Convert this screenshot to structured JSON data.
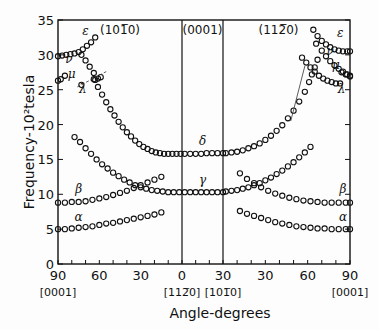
{
  "chart_data": {
    "type": "scatter",
    "title": "",
    "xlabel": "Angle-degrees",
    "ylabel": "Frequency-10²tesla",
    "ylim": [
      0,
      35
    ],
    "yticks": [
      0,
      5,
      10,
      15,
      20,
      25,
      30,
      35
    ],
    "panels": [
      {
        "name": "(10̅1̅0)",
        "label": "(101̅0)",
        "x_from": 90,
        "x_to": 0,
        "ticks": [
          90,
          60,
          30,
          0
        ]
      },
      {
        "name": "(0001)",
        "label": "(0001)",
        "x_from": 0,
        "x_to": 30,
        "ticks": [
          0,
          30
        ]
      },
      {
        "name": "(11̅2̅0)",
        "label": "(112̅0)",
        "x_from": 0,
        "x_to": 90,
        "ticks": [
          30,
          60,
          90
        ]
      }
    ],
    "x_tick_labels": [
      "90",
      "60",
      "30",
      "0",
      "30",
      "30",
      "60",
      "90"
    ],
    "direction_labels": [
      "[0001]",
      "[112̅0]",
      "[101̅0]",
      "[0001]"
    ],
    "series": [
      {
        "name": "alpha",
        "symbol": "α",
        "panel": 0,
        "points": [
          [
            90,
            5.0
          ],
          [
            85,
            5.0
          ],
          [
            80,
            5.1
          ],
          [
            75,
            5.2
          ],
          [
            70,
            5.3
          ],
          [
            65,
            5.4
          ],
          [
            60,
            5.6
          ],
          [
            55,
            5.8
          ],
          [
            50,
            5.9
          ],
          [
            45,
            6.1
          ],
          [
            40,
            6.3
          ],
          [
            35,
            6.5
          ],
          [
            30,
            6.7
          ],
          [
            25,
            6.9
          ],
          [
            20,
            7.1
          ],
          [
            15,
            7.4
          ]
        ]
      },
      {
        "name": "alpha",
        "symbol": "α",
        "panel": 2,
        "points": [
          [
            12,
            7.6
          ],
          [
            17,
            7.2
          ],
          [
            22,
            6.9
          ],
          [
            27,
            6.6
          ],
          [
            32,
            6.3
          ],
          [
            37,
            6.0
          ],
          [
            42,
            5.8
          ],
          [
            47,
            5.6
          ],
          [
            52,
            5.4
          ],
          [
            57,
            5.3
          ],
          [
            62,
            5.2
          ],
          [
            67,
            5.1
          ],
          [
            72,
            5.1
          ],
          [
            77,
            5.0
          ],
          [
            82,
            5.0
          ],
          [
            87,
            5.0
          ],
          [
            90,
            5.0
          ]
        ]
      },
      {
        "name": "beta",
        "symbol": "β",
        "panel": 0,
        "points": [
          [
            90,
            8.8
          ],
          [
            85,
            8.8
          ],
          [
            80,
            8.9
          ],
          [
            75,
            8.9
          ],
          [
            70,
            9.0
          ],
          [
            65,
            9.2
          ],
          [
            60,
            9.4
          ],
          [
            55,
            9.6
          ],
          [
            50,
            9.9
          ],
          [
            45,
            10.2
          ],
          [
            40,
            10.5
          ],
          [
            35,
            10.9
          ],
          [
            30,
            11.3
          ],
          [
            25,
            11.7
          ],
          [
            20,
            12.1
          ],
          [
            15,
            12.5
          ]
        ]
      },
      {
        "name": "beta",
        "symbol": "β",
        "panel": 2,
        "points": [
          [
            12,
            13.0
          ],
          [
            17,
            12.2
          ],
          [
            22,
            11.6
          ],
          [
            27,
            11.0
          ],
          [
            32,
            10.5
          ],
          [
            37,
            10.1
          ],
          [
            42,
            9.8
          ],
          [
            47,
            9.5
          ],
          [
            52,
            9.3
          ],
          [
            57,
            9.1
          ],
          [
            62,
            9.0
          ],
          [
            67,
            8.9
          ],
          [
            72,
            8.8
          ],
          [
            77,
            8.8
          ],
          [
            82,
            8.8
          ],
          [
            87,
            8.8
          ],
          [
            90,
            8.8
          ]
        ]
      },
      {
        "name": "gamma",
        "symbol": "γ",
        "panel": 0,
        "points": [
          [
            78,
            18.2
          ],
          [
            74,
            17.5
          ],
          [
            70,
            16.6
          ],
          [
            66,
            15.8
          ],
          [
            62,
            15.0
          ],
          [
            58,
            14.3
          ],
          [
            54,
            13.7
          ],
          [
            50,
            13.1
          ],
          [
            46,
            12.6
          ],
          [
            42,
            12.1
          ],
          [
            38,
            11.7
          ],
          [
            34,
            11.3
          ],
          [
            30,
            11.0
          ],
          [
            26,
            10.8
          ],
          [
            22,
            10.6
          ],
          [
            18,
            10.5
          ],
          [
            14,
            10.4
          ],
          [
            10,
            10.3
          ],
          [
            6,
            10.3
          ],
          [
            2,
            10.3
          ]
        ]
      },
      {
        "name": "gamma",
        "symbol": "γ",
        "panel": 1,
        "points": [
          [
            2,
            10.3
          ],
          [
            6,
            10.3
          ],
          [
            10,
            10.3
          ],
          [
            14,
            10.3
          ],
          [
            18,
            10.3
          ],
          [
            22,
            10.3
          ],
          [
            26,
            10.3
          ],
          [
            30,
            10.3
          ]
        ]
      },
      {
        "name": "gamma",
        "symbol": "γ",
        "panel": 2,
        "points": [
          [
            2,
            10.4
          ],
          [
            6,
            10.5
          ],
          [
            10,
            10.6
          ],
          [
            14,
            10.8
          ],
          [
            18,
            11.0
          ],
          [
            22,
            11.3
          ],
          [
            26,
            11.6
          ],
          [
            30,
            12.0
          ],
          [
            34,
            12.4
          ],
          [
            38,
            12.9
          ],
          [
            42,
            13.4
          ],
          [
            46,
            14.0
          ],
          [
            50,
            14.6
          ],
          [
            54,
            15.3
          ],
          [
            58,
            16.0
          ],
          [
            62,
            16.8
          ]
        ]
      },
      {
        "name": "delta",
        "symbol": "δ",
        "panel": 0,
        "points": [
          [
            64,
            26.5
          ],
          [
            61,
            25.4
          ],
          [
            58,
            24.3
          ],
          [
            55,
            23.2
          ],
          [
            52,
            22.2
          ],
          [
            49,
            21.3
          ],
          [
            46,
            20.4
          ],
          [
            43,
            19.6
          ],
          [
            40,
            18.9
          ],
          [
            37,
            18.3
          ],
          [
            34,
            17.7
          ],
          [
            31,
            17.2
          ],
          [
            28,
            16.8
          ],
          [
            25,
            16.5
          ],
          [
            22,
            16.2
          ],
          [
            19,
            16.0
          ],
          [
            16,
            15.9
          ],
          [
            13,
            15.8
          ],
          [
            10,
            15.8
          ],
          [
            7,
            15.8
          ],
          [
            4,
            15.8
          ],
          [
            1,
            15.8
          ]
        ]
      },
      {
        "name": "delta",
        "symbol": "δ",
        "panel": 1,
        "points": [
          [
            2,
            15.8
          ],
          [
            6,
            15.8
          ],
          [
            10,
            15.8
          ],
          [
            14,
            15.8
          ],
          [
            18,
            15.9
          ],
          [
            22,
            15.9
          ],
          [
            26,
            15.9
          ],
          [
            30,
            15.9
          ]
        ]
      },
      {
        "name": "delta",
        "symbol": "δ",
        "panel": 2,
        "points": [
          [
            2,
            15.9
          ],
          [
            6,
            16.0
          ],
          [
            10,
            16.1
          ],
          [
            14,
            16.3
          ],
          [
            18,
            16.6
          ],
          [
            22,
            16.9
          ],
          [
            26,
            17.3
          ],
          [
            30,
            17.8
          ],
          [
            34,
            18.4
          ],
          [
            38,
            19.1
          ],
          [
            42,
            19.9
          ],
          [
            46,
            20.9
          ],
          [
            50,
            22.0
          ],
          [
            54,
            23.3
          ],
          [
            58,
            24.7
          ],
          [
            61,
            26.1
          ],
          [
            63,
            27.2
          ],
          [
            65,
            28.2
          ],
          [
            67,
            29.3
          ]
        ]
      },
      {
        "name": "epsilon",
        "symbol": "ε",
        "panel": 0,
        "points": [
          [
            90,
            29.8
          ],
          [
            87,
            29.9
          ],
          [
            84,
            30.0
          ],
          [
            81,
            30.1
          ],
          [
            78,
            30.2
          ],
          [
            75,
            30.4
          ],
          [
            72,
            30.8
          ],
          [
            69,
            31.3
          ],
          [
            66,
            31.8
          ],
          [
            63,
            32.5
          ]
        ]
      },
      {
        "name": "epsilon",
        "symbol": "ε",
        "panel": 2,
        "points": [
          [
            64,
            33.6
          ],
          [
            67,
            32.7
          ],
          [
            70,
            32.0
          ],
          [
            73,
            31.5
          ],
          [
            76,
            31.1
          ],
          [
            79,
            30.8
          ],
          [
            82,
            30.6
          ],
          [
            85,
            30.5
          ],
          [
            88,
            30.5
          ],
          [
            90,
            30.5
          ]
        ]
      },
      {
        "name": "nu",
        "symbol": "ν",
        "panel": 0,
        "points": [
          [
            73,
            30.0
          ],
          [
            70,
            29.2
          ],
          [
            67,
            28.3
          ],
          [
            64,
            27.4
          ],
          [
            61,
            26.6
          ]
        ]
      },
      {
        "name": "nu",
        "symbol": "ν",
        "panel": 2,
        "points": [
          [
            66,
            31.6
          ],
          [
            70,
            30.6
          ],
          [
            73,
            29.8
          ],
          [
            76,
            29.1
          ],
          [
            79,
            28.5
          ],
          [
            82,
            28.0
          ],
          [
            85,
            27.6
          ],
          [
            88,
            27.2
          ],
          [
            90,
            27.0
          ]
        ]
      },
      {
        "name": "mu",
        "symbol": "μ",
        "panel": 0,
        "points": [
          [
            90,
            26.3
          ],
          [
            88,
            26.5
          ],
          [
            85,
            27.0
          ]
        ]
      },
      {
        "name": "mu",
        "symbol": "μ",
        "panel": 2,
        "points": [
          [
            84,
            27.5
          ],
          [
            87,
            27.2
          ],
          [
            90,
            26.9
          ]
        ]
      },
      {
        "name": "lambda",
        "symbol": "λ",
        "panel": 0,
        "points": [
          [
            73,
            25.7
          ],
          [
            63,
            26.4
          ],
          [
            59,
            26.8
          ]
        ]
      },
      {
        "name": "lambda",
        "symbol": "λ",
        "panel": 2,
        "points": [
          [
            56,
            29.6
          ],
          [
            59,
            28.9
          ],
          [
            62,
            28.2
          ],
          [
            65,
            27.6
          ],
          [
            68,
            27.0
          ],
          [
            71,
            26.6
          ],
          [
            74,
            26.3
          ],
          [
            77,
            26.1
          ],
          [
            80,
            25.9
          ],
          [
            83,
            25.9
          ]
        ]
      }
    ],
    "labels": [
      {
        "symbol": "ε",
        "panel": 0,
        "x": 70,
        "y": 32.8
      },
      {
        "symbol": "ν",
        "panel": 0,
        "x": 82,
        "y": 28.8
      },
      {
        "symbol": "μ",
        "panel": 0,
        "x": 80,
        "y": 26.7
      },
      {
        "symbol": "λ",
        "panel": 0,
        "x": 72,
        "y": 24.5
      },
      {
        "symbol": "β",
        "panel": 0,
        "x": 75,
        "y": 10.2
      },
      {
        "symbol": "α",
        "panel": 0,
        "x": 75,
        "y": 6.2
      },
      {
        "symbol": "δ",
        "panel": 1,
        "x": 15,
        "y": 17.0
      },
      {
        "symbol": "γ",
        "panel": 1,
        "x": 15,
        "y": 11.5
      },
      {
        "symbol": "ε",
        "panel": 2,
        "x": 83,
        "y": 32.6
      },
      {
        "symbol": "ν",
        "panel": 2,
        "x": 76,
        "y": 30.0
      },
      {
        "symbol": "μ",
        "panel": 2,
        "x": 80,
        "y": 28.0
      },
      {
        "symbol": "λ",
        "panel": 2,
        "x": 84,
        "y": 24.5
      },
      {
        "symbol": "β",
        "panel": 2,
        "x": 85,
        "y": 10.2
      },
      {
        "symbol": "α",
        "panel": 2,
        "x": 85,
        "y": 6.2
      }
    ],
    "grid": false,
    "legend": "none"
  }
}
